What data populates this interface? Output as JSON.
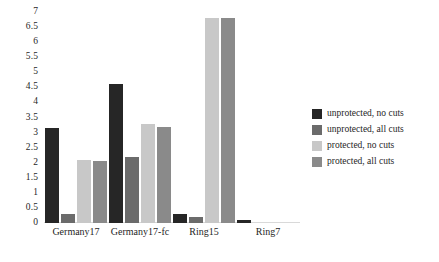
{
  "chart_data": {
    "type": "bar",
    "title": "",
    "subtitle": "",
    "xlabel": "",
    "ylabel": "",
    "ylim": [
      0,
      7
    ],
    "ytick_step": 0.5,
    "ytick_labels": [
      "7",
      "6.5",
      "6",
      "5.5",
      "5",
      "4.5",
      "4",
      "3.5",
      "3",
      "2.5",
      "2",
      "1.5",
      "1",
      "0.5",
      "0"
    ],
    "grid": false,
    "legend_position": "right",
    "categories": [
      "Germany17",
      "Germany17-fc",
      "Ring15",
      "Ring7"
    ],
    "series": [
      {
        "name": "unprotected, no cuts",
        "color": "#262626",
        "values": [
          3.15,
          4.6,
          0.3,
          0.1
        ]
      },
      {
        "name": "unprotected, all cuts",
        "color": "#6b6b6b",
        "values": [
          0.3,
          2.2,
          0.2,
          0
        ]
      },
      {
        "name": "protected, no cuts",
        "color": "#c8c8c8",
        "values": [
          2.1,
          3.3,
          6.8,
          0
        ]
      },
      {
        "name": "protected, all cuts",
        "color": "#8a8a8a",
        "values": [
          2.05,
          3.2,
          6.8,
          0
        ]
      }
    ]
  },
  "legend": {
    "items": [
      {
        "label": "unprotected, no cuts",
        "color": "#262626"
      },
      {
        "label": "unprotected, all cuts",
        "color": "#6b6b6b"
      },
      {
        "label": "protected, no cuts",
        "color": "#c8c8c8"
      },
      {
        "label": "protected, all cuts",
        "color": "#8a8a8a"
      }
    ]
  }
}
